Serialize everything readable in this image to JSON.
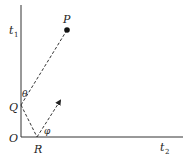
{
  "diagram": {
    "axes": {
      "vertical_label": "t",
      "vertical_subscript": "1",
      "horizontal_label": "t",
      "horizontal_subscript": "2",
      "origin_label": "O"
    },
    "points": {
      "P": "P",
      "Q": "Q",
      "R": "R"
    },
    "angles": {
      "theta": "θ",
      "phi": "φ"
    },
    "colors": {
      "ink": "#222222",
      "background": "#ffffff"
    }
  }
}
